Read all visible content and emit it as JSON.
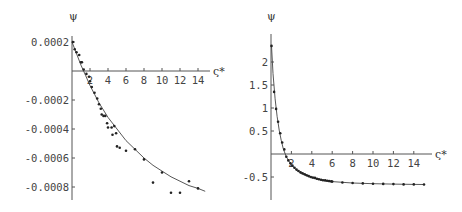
{
  "chart_data": [
    {
      "type": "scatter",
      "title": "",
      "xlabel": "ς*",
      "ylabel": "ψ",
      "xlim": [
        0,
        15
      ],
      "ylim": [
        -0.00085,
        0.0002
      ],
      "xticks": [
        "2",
        "4",
        "6",
        "8",
        "10",
        "12",
        "14"
      ],
      "yticks": [
        "0.0002",
        "-0.0002",
        "-0.0004",
        "-0.0006",
        "-0.0008"
      ],
      "grid": false,
      "legend": null,
      "series": [
        {
          "name": "fit curve",
          "kind": "line",
          "x": [
            0,
            0.5,
            1,
            1.5,
            2,
            2.5,
            3,
            4,
            5,
            6,
            7,
            8,
            9,
            10,
            11,
            12,
            13,
            14,
            14.8
          ],
          "y": [
            0.0002,
            0.00012,
            4e-05,
            -3e-05,
            -0.0001,
            -0.00016,
            -0.00022,
            -0.00032,
            -0.0004,
            -0.00048,
            -0.00054,
            -0.0006,
            -0.00065,
            -0.00069,
            -0.00073,
            -0.00076,
            -0.00079,
            -0.00081,
            -0.00083
          ]
        },
        {
          "name": "data points",
          "kind": "scatter",
          "x": [
            0.1,
            0.3,
            0.5,
            0.8,
            1.0,
            1.1,
            1.3,
            1.6,
            1.9,
            2.0,
            2.2,
            2.5,
            2.8,
            3.0,
            3.2,
            3.3,
            3.5,
            3.7,
            3.9,
            4.0,
            4.4,
            4.5,
            4.7,
            4.9,
            5.0,
            5.3,
            6.0,
            7.0,
            8.0,
            9.0,
            10.0,
            11.0,
            12.0,
            13.0,
            14.0
          ],
          "y": [
            0.0002,
            0.00015,
            0.00013,
            0.00011,
            6e-05,
            6e-05,
            1e-05,
            -2e-05,
            -4e-05,
            -7e-05,
            -0.00011,
            -0.00015,
            -0.00019,
            -0.00023,
            -0.00026,
            -0.0003,
            -0.00031,
            -0.00031,
            -0.00036,
            -0.00039,
            -0.00039,
            -0.00044,
            -0.00038,
            -0.00043,
            -0.00052,
            -0.00053,
            -0.00055,
            -0.00054,
            -0.00061,
            -0.00077,
            -0.0007,
            -0.00084,
            -0.00084,
            -0.00076,
            -0.00081,
            -0.00083,
            -0.00083
          ]
        }
      ]
    },
    {
      "type": "scatter",
      "title": "",
      "xlabel": "ς*",
      "ylabel": "ψ",
      "xlim": [
        0,
        15
      ],
      "ylim": [
        -0.7,
        2.4
      ],
      "xticks": [
        "2",
        "4",
        "6",
        "8",
        "10",
        "12",
        "14"
      ],
      "yticks": [
        "2",
        "1.5",
        "1",
        "0.5",
        "-0.5"
      ],
      "grid": false,
      "legend": null,
      "series": [
        {
          "name": "fit curve",
          "kind": "line",
          "x": [
            0.05,
            0.2,
            0.4,
            0.6,
            0.8,
            1.0,
            1.2,
            1.5,
            2,
            2.5,
            3,
            4,
            5,
            6,
            8,
            10,
            12,
            14,
            15
          ],
          "y": [
            2.35,
            1.75,
            1.2,
            0.82,
            0.52,
            0.3,
            0.12,
            -0.06,
            -0.24,
            -0.35,
            -0.43,
            -0.52,
            -0.57,
            -0.6,
            -0.63,
            -0.645,
            -0.655,
            -0.66,
            -0.662
          ]
        },
        {
          "name": "data points",
          "kind": "scatter",
          "x": [
            0.05,
            0.3,
            0.5,
            0.7,
            0.9,
            1.1,
            1.3,
            1.5,
            1.7,
            1.9,
            2.1,
            2.3,
            2.5,
            2.7,
            2.9,
            3.1,
            3.3,
            3.5,
            3.7,
            3.9,
            4.1,
            4.3,
            4.5,
            4.7,
            4.9,
            5.1,
            5.3,
            5.5,
            5.7,
            5.9,
            6.0,
            7,
            8,
            9,
            10,
            11,
            12,
            13,
            14,
            15
          ],
          "y": [
            2.35,
            1.35,
            0.98,
            0.7,
            0.45,
            0.25,
            0.1,
            -0.06,
            -0.14,
            -0.2,
            -0.25,
            -0.3,
            -0.34,
            -0.37,
            -0.4,
            -0.42,
            -0.44,
            -0.46,
            -0.48,
            -0.5,
            -0.51,
            -0.52,
            -0.54,
            -0.55,
            -0.56,
            -0.57,
            -0.575,
            -0.58,
            -0.59,
            -0.595,
            -0.6,
            -0.62,
            -0.63,
            -0.64,
            -0.645,
            -0.65,
            -0.655,
            -0.66,
            -0.66,
            -0.662
          ]
        }
      ]
    }
  ],
  "left_plot": {
    "ylabel": "ψ",
    "xlabel": "ς*",
    "yticks": [
      "0.0002",
      "-0.0002",
      "-0.0004",
      "-0.0006",
      "-0.0008"
    ],
    "xticks": [
      "2",
      "4",
      "6",
      "8",
      "10",
      "12",
      "14"
    ]
  },
  "right_plot": {
    "ylabel": "ψ",
    "xlabel": "ς*",
    "yticks": [
      "2",
      "1.5",
      "1",
      "0.5",
      "-0.5"
    ],
    "xticks": [
      "2",
      "4",
      "6",
      "8",
      "10",
      "12",
      "14"
    ]
  }
}
